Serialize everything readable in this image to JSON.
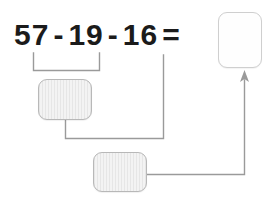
{
  "worksheet": {
    "title": "Subtraction chain worksheet",
    "background_color": "#ffffff"
  },
  "equation": {
    "full_text": "57 - 19 - 16 =",
    "tokens": [
      {
        "text": "57",
        "type": "number"
      },
      {
        "text": "-",
        "type": "operator"
      },
      {
        "text": "19",
        "type": "number"
      },
      {
        "text": "-",
        "type": "operator"
      },
      {
        "text": "16",
        "type": "number"
      },
      {
        "text": "=",
        "type": "operator"
      }
    ],
    "operands": [
      57,
      19,
      16
    ],
    "operator": "subtraction",
    "text_color": "#1b1b1b"
  },
  "slots": {
    "answer": {
      "label": "",
      "placeholder": "",
      "value": "",
      "state": "empty",
      "fill_color": "#fefefe",
      "border_color": "#cfcfcf"
    },
    "step1": {
      "label": "",
      "placeholder": "",
      "value": "",
      "state": "empty",
      "fill_color": "#ececec",
      "border_color": "#b8b8b8"
    },
    "step2": {
      "label": "",
      "placeholder": "",
      "value": "",
      "state": "empty",
      "fill_color": "#ececec",
      "border_color": "#b8b8b8"
    }
  },
  "connectors": {
    "line_color": "#9a9a9a",
    "bracket": {
      "name": "grouping-bracket-first-pair",
      "groups": "57 - 19"
    },
    "arrow": {
      "name": "result-arrow",
      "points_to": "answer-slot",
      "head_direction": "up"
    }
  }
}
